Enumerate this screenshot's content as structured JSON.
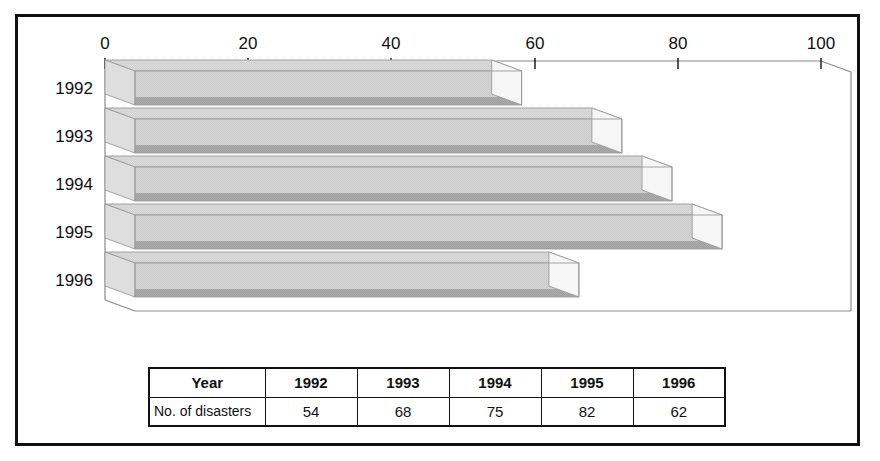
{
  "chart_data": {
    "type": "bar",
    "orientation": "horizontal",
    "style": "3d",
    "title": "",
    "xlabel": "",
    "ylabel": "",
    "categories": [
      "1992",
      "1993",
      "1994",
      "1995",
      "1996"
    ],
    "values": [
      54,
      68,
      75,
      82,
      62
    ],
    "series": [
      {
        "name": "No. of disasters",
        "values": [
          54,
          68,
          75,
          82,
          62
        ]
      }
    ],
    "xlim": [
      0,
      100
    ],
    "ylim": null,
    "xticks": [
      0,
      20,
      40,
      60,
      80,
      100
    ],
    "xtick_labels": [
      "0",
      "20",
      "40",
      "60",
      "80",
      "100"
    ],
    "grid": false,
    "legend": null,
    "bar_face_color": "#d4d4d4",
    "bar_shadow_color": "#a9a9a9",
    "bar_cap_color": "#f2f2f2",
    "axis_color": "#888888",
    "frame_color": "#111111"
  },
  "table": {
    "header": {
      "rowhead": "Year",
      "cells": [
        "1992",
        "1993",
        "1994",
        "1995",
        "1996"
      ]
    },
    "rows": [
      {
        "rowhead": "No. of disasters",
        "cells": [
          "54",
          "68",
          "75",
          "82",
          "62"
        ]
      }
    ]
  }
}
